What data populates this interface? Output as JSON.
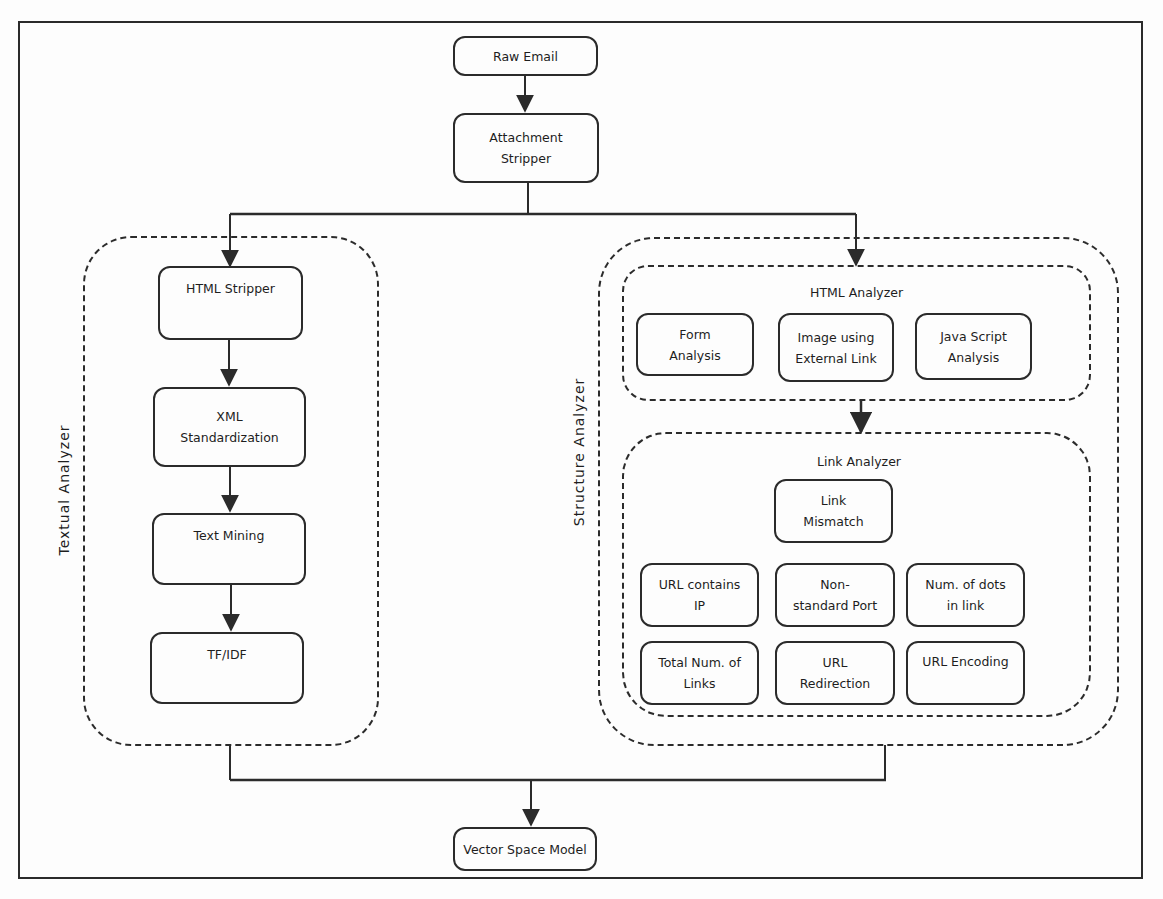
{
  "figure": {
    "nodes": {
      "raw_email": "Raw Email",
      "attachment_stripper": [
        "Attachment",
        "Stripper"
      ],
      "vector_space_model": "Vector Space Model"
    },
    "textual_analyzer": {
      "label": "Textual Analyzer",
      "steps": [
        {
          "lines": [
            "HTML Stripper"
          ]
        },
        {
          "lines": [
            "XML",
            "Standardization"
          ]
        },
        {
          "lines": [
            "Text Mining"
          ]
        },
        {
          "lines": [
            "TF/IDF"
          ]
        }
      ]
    },
    "structure_analyzer": {
      "label": "Structure Analyzer",
      "html_analyzer": {
        "label": "HTML Analyzer",
        "items": [
          {
            "lines": [
              "Form",
              "Analysis"
            ]
          },
          {
            "lines": [
              "Image using",
              "External Link"
            ]
          },
          {
            "lines": [
              "Java Script",
              "Analysis"
            ]
          }
        ]
      },
      "link_analyzer": {
        "label": "Link Analyzer",
        "items": [
          {
            "lines": [
              "Link",
              "Mismatch"
            ]
          },
          {
            "lines": [
              "URL contains",
              "IP"
            ]
          },
          {
            "lines": [
              "Non-",
              "standard Port"
            ]
          },
          {
            "lines": [
              "Num. of dots",
              "in link"
            ]
          },
          {
            "lines": [
              "Total Num. of",
              "Links"
            ]
          },
          {
            "lines": [
              "URL",
              "Redirection"
            ]
          },
          {
            "lines": [
              "URL Encoding"
            ]
          }
        ]
      }
    }
  },
  "colors": {
    "line": "#2b2b2b",
    "background": "#fdfdfd"
  }
}
